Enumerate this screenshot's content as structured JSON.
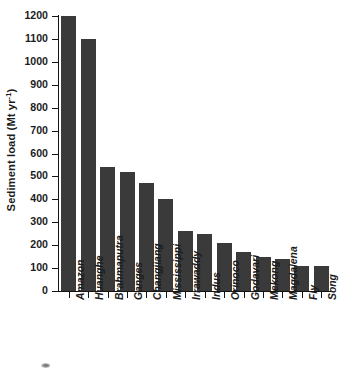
{
  "chart_data": {
    "type": "bar",
    "title": "",
    "subtitle": "",
    "xlabel": "",
    "ylabel": "Sediment load (Mt yr-1)",
    "ylabel_prefix": "Sediment load (Mt yr",
    "ylabel_superscript": "-1",
    "ylabel_suffix": ")",
    "categories": [
      "Amazon",
      "Huanghe",
      "Brahmaputra",
      "Ganges",
      "Changjiang",
      "Mississippi",
      "Irrawaddy",
      "Indus",
      "Orinoco",
      "Godavari",
      "Mekong",
      "Magdalena",
      "Fly",
      "Song"
    ],
    "values": [
      1200,
      1100,
      540,
      520,
      470,
      400,
      260,
      250,
      210,
      170,
      150,
      140,
      110,
      110
    ],
    "ylim": [
      0,
      1200
    ],
    "ytick_values": [
      0,
      100,
      200,
      300,
      400,
      500,
      600,
      700,
      800,
      900,
      1000,
      1100,
      1200
    ],
    "ytick_labels": [
      "0",
      "100",
      "200",
      "300",
      "400",
      "500",
      "600",
      "700",
      "800",
      "900",
      "1000",
      "1100",
      "1200"
    ],
    "grid": false,
    "legend": false,
    "legend_position": "none",
    "bar_color": "#3a3a3a",
    "axis_color": "#141414",
    "background_color": "#ffffff",
    "tick_direction": "out",
    "category_label_rotation": -90,
    "category_label_style": "italic-bold"
  },
  "figure": {
    "artifact_name": "scan-smudge"
  }
}
